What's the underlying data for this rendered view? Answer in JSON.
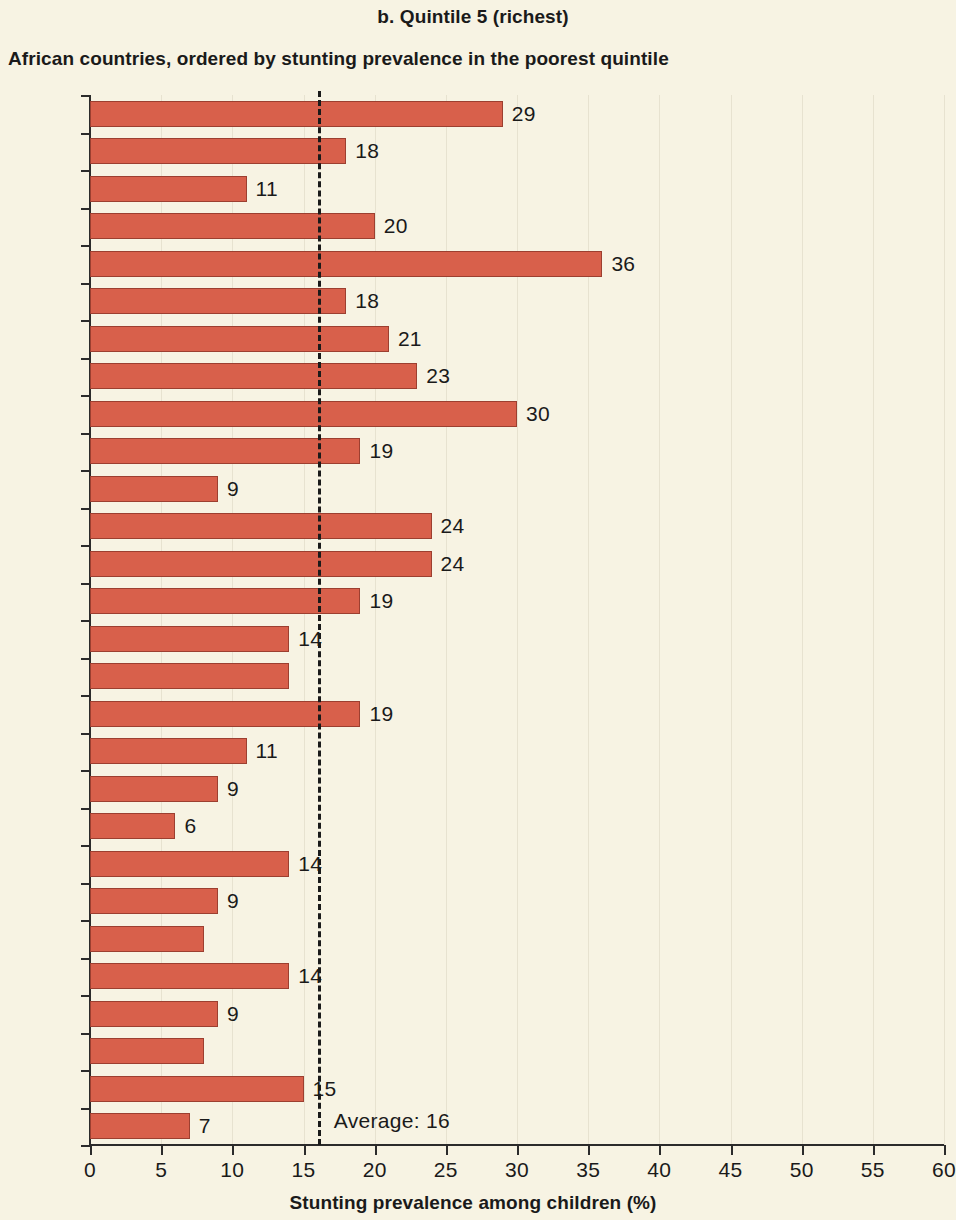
{
  "header": {
    "panel_title": "b. Quintile 5 (richest)",
    "subtitle": "African countries, ordered by stunting prevalence in the poorest quintile"
  },
  "axis": {
    "x_title": "Stunting prevalence among children (%)",
    "x_ticks": [
      "0",
      "5",
      "10",
      "15",
      "20",
      "25",
      "30",
      "35",
      "40",
      "45",
      "50",
      "55",
      "60"
    ]
  },
  "annotation": {
    "average_label": "Average: 16"
  },
  "chart_data": {
    "type": "bar",
    "orientation": "horizontal",
    "title": "b. Quintile 5 (richest)",
    "subtitle": "African countries, ordered by stunting prevalence in the poorest quintile",
    "xlabel": "Stunting prevalence among children (%)",
    "ylabel": "",
    "xlim": [
      0,
      60
    ],
    "xticks": [
      0,
      5,
      10,
      15,
      20,
      25,
      30,
      35,
      40,
      45,
      50,
      55,
      60
    ],
    "grid": true,
    "legend": null,
    "bar_color": "#d8604b",
    "background_color": "#f7f3e3",
    "average_line": {
      "value": 16,
      "label": "Average: 16",
      "style": "dashed",
      "color": "#1a1a1a"
    },
    "categories": [
      "ERI",
      "COD",
      "RWA",
      "AGO",
      "GNQ",
      "LSO",
      "SDN",
      "ETH",
      "MDG",
      "BEN",
      "CMR",
      "ZMB",
      "COM",
      "GIN",
      "LBR",
      "KEN",
      "BWA",
      "TGO",
      "NAM",
      "GAB",
      "COG",
      "SWZ",
      "CIV",
      "ZWE",
      "SEN",
      "GHA",
      "GMB",
      "STP"
    ],
    "values": [
      29,
      18,
      11,
      20,
      36,
      18,
      21,
      23,
      30,
      19,
      9,
      24,
      24,
      19,
      14,
      14,
      19,
      11,
      9,
      6,
      14,
      9,
      8,
      14,
      9,
      8,
      15,
      7
    ],
    "data_labels": [
      "29",
      "18",
      "11",
      "20",
      "36",
      "18",
      "21",
      "23",
      "30",
      "19",
      "9",
      "24",
      "24",
      "19",
      "14",
      "",
      "19",
      "11",
      "9",
      "6",
      "14",
      "9",
      "",
      "14",
      "9",
      "",
      "15",
      "7"
    ],
    "bars": [
      {
        "category": "ERI",
        "value": 29,
        "label": "29"
      },
      {
        "category": "COD",
        "value": 18,
        "label": "18"
      },
      {
        "category": "RWA",
        "value": 11,
        "label": "11"
      },
      {
        "category": "AGO",
        "value": 20,
        "label": "20"
      },
      {
        "category": "GNQ",
        "value": 36,
        "label": "36"
      },
      {
        "category": "LSO",
        "value": 18,
        "label": "18"
      },
      {
        "category": "SDN",
        "value": 21,
        "label": "21"
      },
      {
        "category": "ETH",
        "value": 23,
        "label": "23"
      },
      {
        "category": "MDG",
        "value": 30,
        "label": "30"
      },
      {
        "category": "BEN",
        "value": 19,
        "label": "19"
      },
      {
        "category": "CMR",
        "value": 9,
        "label": "9"
      },
      {
        "category": "ZMB",
        "value": 24,
        "label": "24"
      },
      {
        "category": "COM",
        "value": 24,
        "label": "24"
      },
      {
        "category": "GIN",
        "value": 19,
        "label": "19"
      },
      {
        "category": "LBR",
        "value": 14,
        "label": "14"
      },
      {
        "category": "KEN",
        "value": 14,
        "label": ""
      },
      {
        "category": "BWA",
        "value": 19,
        "label": "19"
      },
      {
        "category": "TGO",
        "value": 11,
        "label": "11"
      },
      {
        "category": "NAM",
        "value": 9,
        "label": "9"
      },
      {
        "category": "GAB",
        "value": 6,
        "label": "6"
      },
      {
        "category": "COG",
        "value": 14,
        "label": "14"
      },
      {
        "category": "SWZ",
        "value": 9,
        "label": "9"
      },
      {
        "category": "CIV",
        "value": 8,
        "label": ""
      },
      {
        "category": "ZWE",
        "value": 14,
        "label": "14"
      },
      {
        "category": "SEN",
        "value": 9,
        "label": "9"
      },
      {
        "category": "GHA",
        "value": 8,
        "label": ""
      },
      {
        "category": "GMB",
        "value": 15,
        "label": "15"
      },
      {
        "category": "STP",
        "value": 7,
        "label": "7"
      }
    ]
  }
}
